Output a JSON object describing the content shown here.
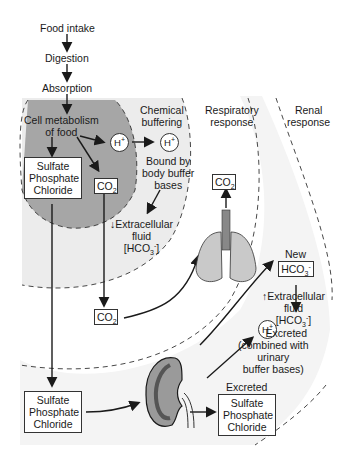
{
  "flow": {
    "food_intake": "Food intake",
    "digestion": "Digestion",
    "absorption": "Absorption",
    "cell_metabolism": [
      "Cell metabolism",
      "of food"
    ]
  },
  "zones": {
    "chemical": [
      "Chemical",
      "buffering"
    ],
    "respiratory": [
      "Respiratory",
      "response"
    ],
    "renal": [
      "Renal",
      "response"
    ]
  },
  "ions": {
    "h_plus": "H",
    "h_plus_sup": "+",
    "co2": "CO",
    "co2_sub": "2",
    "hco3": "HCO",
    "hco3_sub": "3",
    "hco3_sup": "-"
  },
  "labels": {
    "bound_by": [
      "Bound by",
      "body buffer",
      "bases"
    ],
    "ecf_down": [
      "↓Extracellular",
      "fluid",
      "[HCO"
    ],
    "ecf_bracket": "]",
    "new": "New",
    "ecf_up": [
      "↑Extracellular",
      "fluid",
      "[HCO"
    ],
    "excreted_h": [
      "Excreted",
      "(combined with",
      "urinary",
      "buffer bases)"
    ],
    "excreted": "Excreted"
  },
  "boxes": {
    "anions": [
      "Sulfate",
      "Phosphate",
      "Chloride"
    ]
  },
  "colors": {
    "inner_zone": "#a6a6a6",
    "chemical_zone": "#ececec",
    "renal_band": "#f2f2f2",
    "line": "#1a1a1a"
  }
}
